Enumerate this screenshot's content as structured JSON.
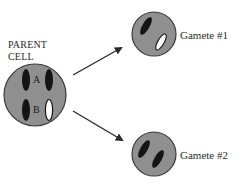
{
  "parent_cell": {
    "label_line1": "PARENT",
    "label_line2": "CELL",
    "chromosome_labels": [
      "A",
      "B"
    ],
    "chromosomes": [
      {
        "pair": "A",
        "side": "left",
        "fill": "dark"
      },
      {
        "pair": "A",
        "side": "right",
        "fill": "dark"
      },
      {
        "pair": "B",
        "side": "left",
        "fill": "dark"
      },
      {
        "pair": "B",
        "side": "right",
        "fill": "white"
      }
    ]
  },
  "gametes": [
    {
      "label": "Gamete #1",
      "chromosomes": [
        {
          "pair": "A",
          "fill": "dark"
        },
        {
          "pair": "B",
          "fill": "white"
        }
      ]
    },
    {
      "label": "Gamete #2",
      "chromosomes": [
        {
          "pair": "A",
          "fill": "dark"
        },
        {
          "pair": "B",
          "fill": "dark"
        }
      ]
    }
  ],
  "colors": {
    "cell_fill": "#8f8f8f",
    "cell_stroke": "#3a3a3a",
    "chromosome_dark": "#141414",
    "chromosome_light": "#ffffff",
    "arrow": "#2a2a2a",
    "text": "#2a2a2a"
  }
}
